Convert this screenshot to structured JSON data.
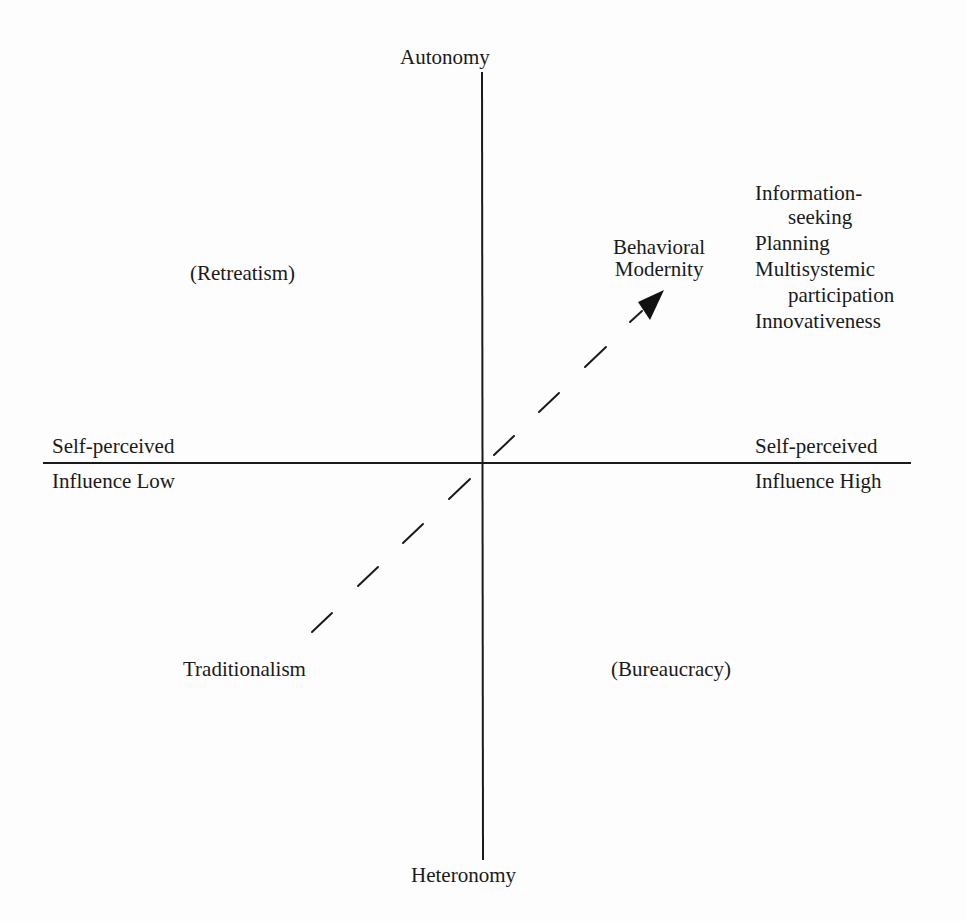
{
  "axes": {
    "vertical_top": "Autonomy",
    "vertical_bottom": "Heteronomy",
    "horizontal_left_top": "Self-perceived",
    "horizontal_left_bottom": "Influence Low",
    "horizontal_right_top": "Self-perceived",
    "horizontal_right_bottom": "Influence High"
  },
  "quadrants": {
    "upper_left": "(Retreatism)",
    "lower_left": "Traditionalism",
    "lower_right": "(Bureaucracy)",
    "upper_right": {
      "line1": "Behavioral",
      "line2": "Modernity"
    }
  },
  "modernity_traits": [
    "Information-",
    "seeking",
    "Planning",
    "Multisystemic",
    "participation",
    "Innovativeness"
  ],
  "arrow": {
    "style": "dashed",
    "from": "Traditionalism",
    "to": "Behavioral Modernity"
  }
}
